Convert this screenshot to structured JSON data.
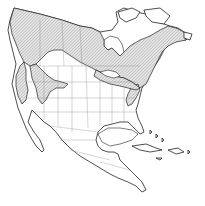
{
  "map": {
    "region": "North America",
    "type": "species range map",
    "background_color": "#ffffff",
    "outline_color": "#222222",
    "border_color": "#888888",
    "range_fill": "hatched gray",
    "range_hatch_color": "#9a9a9a",
    "range_areas": [
      "boreal Canada and Alaska",
      "Rocky Mountains",
      "Cascades / Sierra Nevada",
      "Great Lakes and northeastern US",
      "Appalachian Mountains"
    ]
  }
}
